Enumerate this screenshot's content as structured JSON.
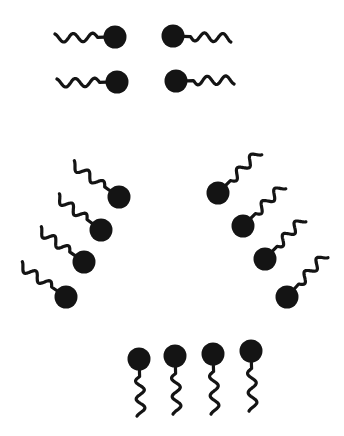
{
  "figure": {
    "colors": {
      "background": "#ffffff",
      "molecule": "#141414"
    },
    "head_radius": 11.5
  },
  "groups": [
    {
      "name": "top-pairs",
      "molecules": [
        {
          "head": [
            115,
            37
          ],
          "tail_end": [
            55,
            38
          ]
        },
        {
          "head": [
            173,
            36
          ],
          "tail_end": [
            231,
            38
          ]
        },
        {
          "head": [
            117,
            82
          ],
          "tail_end": [
            57,
            83
          ]
        },
        {
          "head": [
            176,
            81
          ],
          "tail_end": [
            234,
            80
          ]
        }
      ]
    },
    {
      "name": "left-diagonal",
      "molecules": [
        {
          "head": [
            119,
            197
          ],
          "tail_end": [
            72,
            164
          ]
        },
        {
          "head": [
            101,
            230
          ],
          "tail_end": [
            57,
            197
          ]
        },
        {
          "head": [
            84,
            262
          ],
          "tail_end": [
            39,
            230
          ]
        },
        {
          "head": [
            66,
            297
          ],
          "tail_end": [
            20,
            265
          ]
        }
      ]
    },
    {
      "name": "right-diagonal",
      "molecules": [
        {
          "head": [
            218,
            193
          ],
          "tail_end": [
            259,
            152
          ]
        },
        {
          "head": [
            243,
            226
          ],
          "tail_end": [
            283,
            186
          ]
        },
        {
          "head": [
            265,
            259
          ],
          "tail_end": [
            303,
            219
          ]
        },
        {
          "head": [
            287,
            297
          ],
          "tail_end": [
            325,
            255
          ]
        }
      ]
    },
    {
      "name": "bottom-row",
      "molecules": [
        {
          "head": [
            139,
            359
          ],
          "tail_end": [
            141,
            416
          ]
        },
        {
          "head": [
            175,
            356
          ],
          "tail_end": [
            177,
            414
          ]
        },
        {
          "head": [
            213,
            354
          ],
          "tail_end": [
            215,
            414
          ]
        },
        {
          "head": [
            251,
            351
          ],
          "tail_end": [
            253,
            411
          ]
        }
      ]
    }
  ]
}
